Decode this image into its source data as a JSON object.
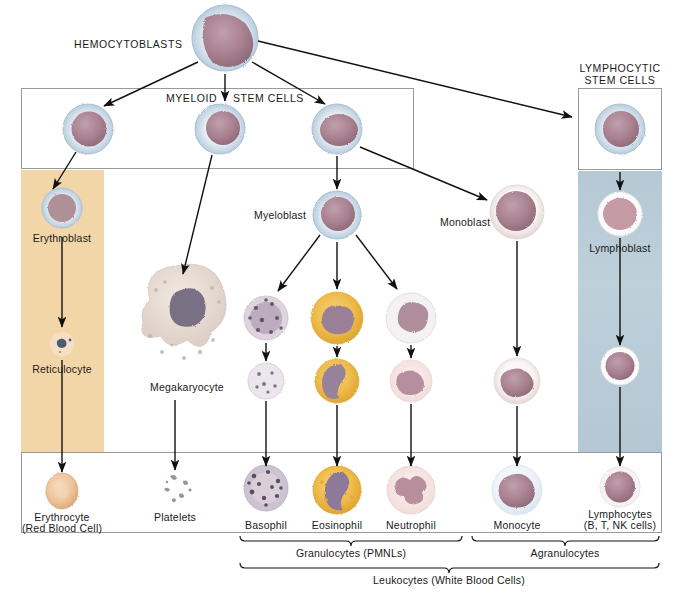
{
  "figure": {
    "type": "diagram"
  },
  "labels": {
    "hemocytoblasts": "HEMOCYTOBLASTS",
    "myeloid": "MYELOID",
    "stem_cells": "STEM CELLS",
    "lymphocytic_l1": "LYMPHOCYTIC",
    "lymphocytic_l2": "STEM CELLS",
    "erythroblast": "Erythroblast",
    "reticulocyte": "Reticulocyte",
    "megakaryocyte": "Megakaryocyte",
    "myeloblast": "Myeloblast",
    "monoblast": "Monoblast",
    "lymphoblast": "Lymphoblast",
    "erythrocyte_l1": "Erythrocyte",
    "erythrocyte_l2": "(Red Blood Cell)",
    "platelets": "Platelets",
    "basophil": "Basophil",
    "eosinophil": "Eosinophil",
    "neutrophil": "Neutrophil",
    "monocyte": "Monocyte",
    "lymphocytes_l1": "Lymphocytes",
    "lymphocytes_l2": "(B, T, NK cells)",
    "granulocytes": "Granulocytes (PMNLs)",
    "agranulocytes": "Agranulocytes",
    "leukocytes": "Leukocytes (White Blood Cells)"
  },
  "colors": {
    "erythroid_band": "#f3d6a8",
    "lymphoid_band": "#b8cbd6",
    "box_border": "#9a9a9a",
    "arrow": "#111111",
    "text": "#1a1a1a",
    "eosinophil_cytoplasm": "#f0bd4e",
    "basophil_granules": "#6b5d78",
    "neutrophil_cytoplasm": "#f6e2e2",
    "nucleus": "#a9808f",
    "erythrocyte": "#eec49a",
    "monocyte_cytoplasm": "#e9eef5"
  },
  "bands": [
    {
      "name": "erythroid-band",
      "x": 21,
      "y": 170,
      "w": 83,
      "h": 282,
      "color": "#f3d6a8"
    },
    {
      "name": "lymphoid-band",
      "x": 578,
      "y": 171,
      "w": 84,
      "h": 281,
      "color": "#b8cbd6"
    }
  ],
  "boxes": [
    {
      "name": "myeloid-stem-cells-box",
      "x": 21,
      "y": 88,
      "w": 393,
      "h": 81
    },
    {
      "name": "lymphocytic-stem-cells-box",
      "x": 578,
      "y": 88,
      "w": 84,
      "h": 82
    },
    {
      "name": "mature-cells-box",
      "x": 21,
      "y": 452,
      "w": 641,
      "h": 81
    }
  ],
  "cells": [
    {
      "name": "hemocytoblast",
      "x": 225,
      "y": 38,
      "r": 34,
      "kind": "blast-blue"
    },
    {
      "name": "myeloid-stem-cell-1",
      "x": 88,
      "y": 129,
      "r": 25,
      "kind": "blast-blue"
    },
    {
      "name": "myeloid-stem-cell-2",
      "x": 220,
      "y": 129,
      "r": 25,
      "kind": "blast-blue"
    },
    {
      "name": "myeloid-stem-cell-3",
      "x": 337,
      "y": 129,
      "r": 25,
      "kind": "blast-blue"
    },
    {
      "name": "lymphocytic-stem-cell",
      "x": 620,
      "y": 129,
      "r": 25,
      "kind": "blast-pink"
    },
    {
      "name": "erythroblast",
      "x": 62,
      "y": 208,
      "r": 20,
      "kind": "erythroblast"
    },
    {
      "name": "reticulocyte",
      "x": 62,
      "y": 344,
      "r": 12,
      "kind": "reticulocyte"
    },
    {
      "name": "megakaryocyte",
      "x": 187,
      "y": 320,
      "r": 42,
      "kind": "megakaryocyte"
    },
    {
      "name": "myeloblast",
      "x": 337,
      "y": 215,
      "r": 24,
      "kind": "blast-blue"
    },
    {
      "name": "basophil-band",
      "x": 266,
      "y": 318,
      "r": 22,
      "kind": "basophil"
    },
    {
      "name": "eosinophil-band",
      "x": 337,
      "y": 318,
      "r": 26,
      "kind": "eosinophil"
    },
    {
      "name": "neutrophil-band",
      "x": 411,
      "y": 318,
      "r": 25,
      "kind": "neutrophil-band"
    },
    {
      "name": "basophil-pre",
      "x": 266,
      "y": 381,
      "r": 18,
      "kind": "basophil2"
    },
    {
      "name": "eosinophil-pre",
      "x": 337,
      "y": 381,
      "r": 22,
      "kind": "eosinophil2"
    },
    {
      "name": "neutrophil-pre",
      "x": 411,
      "y": 381,
      "r": 21,
      "kind": "neutrophil2"
    },
    {
      "name": "monoblast",
      "x": 517,
      "y": 212,
      "r": 27,
      "kind": "blast-pink"
    },
    {
      "name": "monocyte-pre",
      "x": 517,
      "y": 381,
      "r": 23,
      "kind": "monocyte"
    },
    {
      "name": "lymphoblast",
      "x": 620,
      "y": 214,
      "r": 22,
      "kind": "lymphoblast"
    },
    {
      "name": "lymphocyte-mid",
      "x": 620,
      "y": 366,
      "r": 19,
      "kind": "lymphocyte"
    },
    {
      "name": "erythrocyte",
      "x": 62,
      "y": 491,
      "r": 17,
      "kind": "erythrocyte"
    },
    {
      "name": "platelets",
      "x": 175,
      "y": 488,
      "r": 16,
      "kind": "platelets"
    },
    {
      "name": "basophil",
      "x": 266,
      "y": 488,
      "r": 22,
      "kind": "basophil3"
    },
    {
      "name": "eosinophil",
      "x": 337,
      "y": 490,
      "r": 24,
      "kind": "eosinophil3"
    },
    {
      "name": "neutrophil",
      "x": 411,
      "y": 490,
      "r": 24,
      "kind": "neutrophil3"
    },
    {
      "name": "monocyte",
      "x": 517,
      "y": 490,
      "r": 25,
      "kind": "monocyte2"
    },
    {
      "name": "lymphocyte",
      "x": 620,
      "y": 487,
      "r": 20,
      "kind": "lymphocyte2"
    }
  ],
  "arrows": [
    {
      "name": "arrow-hemocytoblast-to-stem1",
      "x1": 198,
      "y1": 62,
      "x2": 104,
      "y2": 106
    },
    {
      "name": "arrow-hemocytoblast-to-stem2",
      "x1": 225,
      "y1": 74,
      "x2": 225,
      "y2": 101
    },
    {
      "name": "arrow-hemocytoblast-to-stem3",
      "x1": 252,
      "y1": 62,
      "x2": 325,
      "y2": 104
    },
    {
      "name": "arrow-hemocytoblast-to-lymphocytic",
      "x1": 258,
      "y1": 41,
      "x2": 572,
      "y2": 117
    },
    {
      "name": "arrow-stem1-to-erythroblast",
      "x1": 76,
      "y1": 152,
      "x2": 52,
      "y2": 188
    },
    {
      "name": "arrow-stem2-to-megakaryocyte",
      "x1": 212,
      "y1": 155,
      "x2": 182,
      "y2": 272
    },
    {
      "name": "arrow-stem3-to-myeloblast",
      "x1": 337,
      "y1": 156,
      "x2": 337,
      "y2": 188
    },
    {
      "name": "arrow-stem3-to-monoblast",
      "x1": 360,
      "y1": 147,
      "x2": 488,
      "y2": 201
    },
    {
      "name": "arrow-lymphocytic-to-lymphoblast",
      "x1": 620,
      "y1": 173,
      "x2": 620,
      "y2": 190
    },
    {
      "name": "arrow-erythroblast-to-reticulocyte",
      "x1": 62,
      "y1": 237,
      "x2": 62,
      "y2": 325
    },
    {
      "name": "arrow-myeloblast-to-basophil",
      "x1": 318,
      "y1": 236,
      "x2": 277,
      "y2": 290
    },
    {
      "name": "arrow-myeloblast-to-eosinophil",
      "x1": 337,
      "y1": 242,
      "x2": 337,
      "y2": 288
    },
    {
      "name": "arrow-myeloblast-to-neutrophil",
      "x1": 357,
      "y1": 236,
      "x2": 398,
      "y2": 288
    },
    {
      "name": "arrow-basophil-band-to-pre",
      "x1": 266,
      "y1": 344,
      "x2": 266,
      "y2": 360
    },
    {
      "name": "arrow-eosinophil-band-to-pre",
      "x1": 337,
      "y1": 347,
      "x2": 337,
      "y2": 357
    },
    {
      "name": "arrow-neutrophil-band-to-pre",
      "x1": 411,
      "y1": 346,
      "x2": 411,
      "y2": 357
    },
    {
      "name": "arrow-monoblast-to-monocyte-pre",
      "x1": 517,
      "y1": 241,
      "x2": 517,
      "y2": 356
    },
    {
      "name": "arrow-lymphoblast-to-lymphocyte",
      "x1": 620,
      "y1": 239,
      "x2": 620,
      "y2": 345
    },
    {
      "name": "arrow-reticulocyte-to-erythrocyte",
      "x1": 62,
      "y1": 360,
      "x2": 62,
      "y2": 472
    },
    {
      "name": "arrow-megakaryocyte-to-platelets",
      "x1": 175,
      "y1": 400,
      "x2": 175,
      "y2": 470
    },
    {
      "name": "arrow-basophil-pre-to-mature",
      "x1": 266,
      "y1": 400,
      "x2": 266,
      "y2": 466
    },
    {
      "name": "arrow-eosinophil-pre-to-mature",
      "x1": 337,
      "y1": 404,
      "x2": 337,
      "y2": 466
    },
    {
      "name": "arrow-neutrophil-pre-to-mature",
      "x1": 411,
      "y1": 403,
      "x2": 411,
      "y2": 466
    },
    {
      "name": "arrow-monocyte-pre-to-mature",
      "x1": 517,
      "y1": 405,
      "x2": 517,
      "y2": 466
    },
    {
      "name": "arrow-lymphocyte-to-mature",
      "x1": 620,
      "y1": 386,
      "x2": 620,
      "y2": 466
    }
  ],
  "brackets": [
    {
      "name": "granulocytes-bracket",
      "x1": 240,
      "x2": 462,
      "y": 540,
      "label_x": 351,
      "label_y": 548
    },
    {
      "name": "agranulocytes-bracket",
      "x1": 472,
      "x2": 659,
      "y": 540,
      "label_x": 565,
      "label_y": 548
    },
    {
      "name": "leukocytes-bracket",
      "x1": 240,
      "x2": 659,
      "y": 567,
      "label_x": 449,
      "label_y": 575
    }
  ]
}
